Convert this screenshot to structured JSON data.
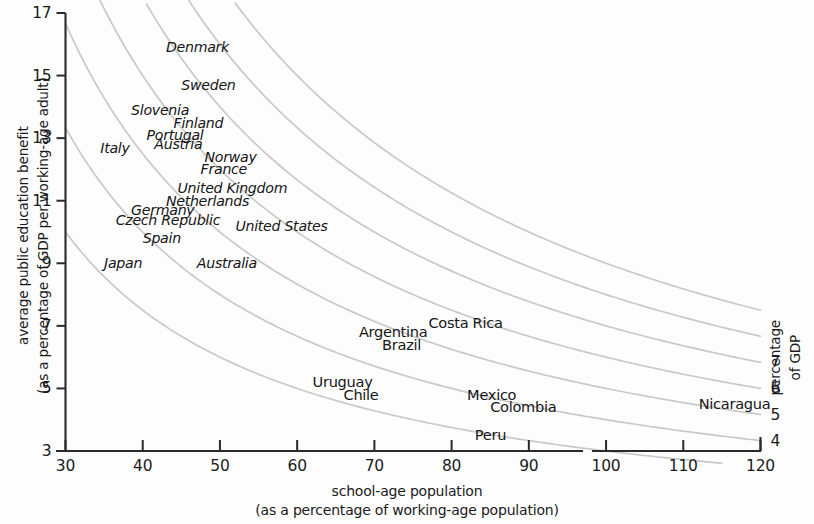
{
  "chart_data": {
    "type": "scatter",
    "title": "",
    "xlabel": "school-age population (as a percentage of working-age population)",
    "xlabel_line1": "school-age population",
    "xlabel_line2": "(as a percentage of working-age population)",
    "ylabel": "average public education benefit (as a percentage of GDP per working-age adult)",
    "ylabel_line1": "average public education benefit",
    "ylabel_line2": "(as a percentage of GDP per working-age adult)",
    "right_axis_label_line1": "percentage",
    "right_axis_label_line2": "of GDP",
    "xlim": [
      30,
      120
    ],
    "ylim": [
      3,
      17
    ],
    "xticks": [
      30,
      40,
      50,
      60,
      70,
      80,
      90,
      100,
      110,
      120
    ],
    "yticks": [
      3,
      5,
      7,
      9,
      11,
      13,
      15,
      17
    ],
    "grid": false,
    "legend": "none",
    "xaxis_break_at": 97,
    "iso_curves": {
      "formula": "y = 100 * c / x",
      "levels": [
        3,
        4,
        5,
        6,
        7,
        8,
        9
      ],
      "right_edge_labels": [
        {
          "value": "7",
          "c": 7
        },
        {
          "value": "6",
          "c": 6
        },
        {
          "value": "5",
          "c": 5
        },
        {
          "value": "4",
          "c": 4
        }
      ],
      "color": "#c9c9c9"
    },
    "points": [
      {
        "label": "Denmark",
        "x": 43.0,
        "y": 15.9,
        "group": "europe"
      },
      {
        "label": "Sweden",
        "x": 45.0,
        "y": 14.7,
        "group": "europe"
      },
      {
        "label": "Slovenia",
        "x": 38.5,
        "y": 13.9,
        "group": "europe"
      },
      {
        "label": "Finland",
        "x": 44.0,
        "y": 13.5,
        "group": "europe"
      },
      {
        "label": "Portugal",
        "x": 40.5,
        "y": 13.1,
        "group": "europe"
      },
      {
        "label": "Italy",
        "x": 34.5,
        "y": 12.7,
        "group": "europe"
      },
      {
        "label": "Austria",
        "x": 41.5,
        "y": 12.8,
        "group": "europe"
      },
      {
        "label": "Norway",
        "x": 48.0,
        "y": 12.4,
        "group": "europe"
      },
      {
        "label": "France",
        "x": 47.5,
        "y": 12.0,
        "group": "europe"
      },
      {
        "label": "United Kingdom",
        "x": 44.5,
        "y": 11.4,
        "group": "europe"
      },
      {
        "label": "Netherlands",
        "x": 43.0,
        "y": 11.0,
        "group": "europe"
      },
      {
        "label": "Germany",
        "x": 38.5,
        "y": 10.7,
        "group": "europe"
      },
      {
        "label": "Czech Republic",
        "x": 36.5,
        "y": 10.4,
        "group": "europe"
      },
      {
        "label": "United States",
        "x": 52.0,
        "y": 10.2,
        "group": "europe"
      },
      {
        "label": "Spain",
        "x": 40.0,
        "y": 9.8,
        "group": "europe"
      },
      {
        "label": "Japan",
        "x": 35.0,
        "y": 9.0,
        "group": "europe"
      },
      {
        "label": "Australia",
        "x": 47.0,
        "y": 9.0,
        "group": "europe"
      },
      {
        "label": "Argentina",
        "x": 68.0,
        "y": 6.8,
        "group": "latam"
      },
      {
        "label": "Costa Rica",
        "x": 77.0,
        "y": 7.1,
        "group": "latam"
      },
      {
        "label": "Brazil",
        "x": 71.0,
        "y": 6.4,
        "group": "latam"
      },
      {
        "label": "Uruguay",
        "x": 62.0,
        "y": 5.2,
        "group": "latam"
      },
      {
        "label": "Chile",
        "x": 66.0,
        "y": 4.8,
        "group": "latam"
      },
      {
        "label": "Mexico",
        "x": 82.0,
        "y": 4.8,
        "group": "latam"
      },
      {
        "label": "Colombia",
        "x": 85.0,
        "y": 4.4,
        "group": "latam"
      },
      {
        "label": "Peru",
        "x": 83.0,
        "y": 3.5,
        "group": "latam"
      },
      {
        "label": "Nicaragua",
        "x": 112.0,
        "y": 4.5,
        "group": "latam"
      }
    ]
  },
  "axes": {
    "x_ticks": [
      "30",
      "40",
      "50",
      "60",
      "70",
      "80",
      "90",
      "100",
      "110",
      "120"
    ],
    "y_ticks": [
      "17",
      "15",
      "13",
      "11",
      "9",
      "7",
      "5",
      "3"
    ],
    "right_ticks": [
      "7",
      "6",
      "5",
      "4"
    ]
  },
  "labels": {
    "x_title_line1": "school-age population",
    "x_title_line2": "(as a percentage of working-age population)",
    "y_title_line1": "average public education benefit",
    "y_title_line2": "(as a percentage of GDP per working-age adult)",
    "right_title_line1": "percentage",
    "right_title_line2": "of GDP"
  }
}
